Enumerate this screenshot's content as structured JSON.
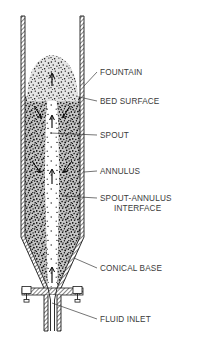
{
  "figure": {
    "background_color": "#ffffff",
    "line_color": "#1a1a1a",
    "label_color": "#3a3a3a",
    "particle_color": "#111111"
  },
  "labels": [
    {
      "id": "fountain",
      "text": "FOUNTAIN",
      "text2": "",
      "x": 100,
      "y": 75,
      "leader_x1": 84,
      "leader_y1": 86,
      "leader_x2": 97,
      "leader_y2": 72
    },
    {
      "id": "bed-surface",
      "text": "BED SURFACE",
      "text2": "",
      "x": 100,
      "y": 104,
      "leader_x1": 80,
      "leader_y1": 97,
      "leader_x2": 97,
      "leader_y2": 101
    },
    {
      "id": "spout",
      "text": "SPOUT",
      "text2": "",
      "x": 100,
      "y": 138,
      "leader_x1": 50,
      "leader_y1": 133,
      "leader_x2": 97,
      "leader_y2": 135
    },
    {
      "id": "annulus",
      "text": "ANNULUS",
      "text2": "",
      "x": 100,
      "y": 174,
      "leader_x1": 84,
      "leader_y1": 172,
      "leader_x2": 97,
      "leader_y2": 171
    },
    {
      "id": "spout-annulus",
      "text": "SPOUT-ANNULUS",
      "text2": "INTERFACE",
      "x": 100,
      "y": 201,
      "leader_x1": 62,
      "leader_y1": 196,
      "leader_x2": 97,
      "leader_y2": 198
    },
    {
      "id": "conical-base",
      "text": "CONICAL BASE",
      "text2": "",
      "x": 100,
      "y": 271,
      "leader_x1": 74,
      "leader_y1": 258,
      "leader_x2": 97,
      "leader_y2": 268
    },
    {
      "id": "fluid-inlet",
      "text": "FLUID INLET",
      "text2": "",
      "x": 100,
      "y": 322,
      "leader_x1": 52,
      "leader_y1": 303,
      "leader_x2": 97,
      "leader_y2": 319
    }
  ],
  "vessel": {
    "column_left": 21,
    "column_right": 84,
    "column_top": 16,
    "cone_top": 237,
    "cone_bottom": 288,
    "throat_left": 47,
    "throat_right": 58,
    "inlet_bottom": 331,
    "wall_thickness": 4,
    "bed_surface_y": 96,
    "fountain_top_y": 55,
    "spout_center_x": 52
  }
}
